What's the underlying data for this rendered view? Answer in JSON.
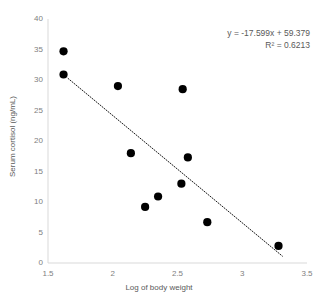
{
  "chart_data": {
    "type": "scatter",
    "title": "",
    "xlabel": "Log of body weight",
    "ylabel": "Serum cortisol (ng/mL)",
    "xlim": [
      1.5,
      3.5
    ],
    "ylim": [
      0,
      40
    ],
    "xticks": [
      "1.5",
      "2",
      "2.5",
      "3",
      "3.5"
    ],
    "xtick_values": [
      1.5,
      2,
      2.5,
      3,
      3.5
    ],
    "yticks": [
      "0",
      "5",
      "10",
      "15",
      "20",
      "25",
      "30",
      "35",
      "40"
    ],
    "ytick_values": [
      0,
      5,
      10,
      15,
      20,
      25,
      30,
      35,
      40
    ],
    "grid": false,
    "legend": "none",
    "marker_color": "#000000",
    "marker_shape": "circle",
    "axis_color": "#d9d9d9",
    "text_color": "#595959",
    "tick_color": "#808080",
    "points": [
      {
        "x": 1.62,
        "y": 34.7
      },
      {
        "x": 1.62,
        "y": 30.9
      },
      {
        "x": 2.04,
        "y": 29.0
      },
      {
        "x": 2.54,
        "y": 28.5
      },
      {
        "x": 2.14,
        "y": 18.0
      },
      {
        "x": 2.58,
        "y": 17.3
      },
      {
        "x": 2.53,
        "y": 13.0
      },
      {
        "x": 2.35,
        "y": 10.9
      },
      {
        "x": 2.25,
        "y": 9.2
      },
      {
        "x": 2.73,
        "y": 6.7
      },
      {
        "x": 3.28,
        "y": 2.8
      }
    ],
    "trendline": {
      "type": "linear",
      "style": "dotted",
      "color": "#000000",
      "slope": -17.599,
      "intercept": 59.379,
      "x_start": 1.655,
      "x_end": 3.31
    },
    "annotations": {
      "equation": "y = -17.599x + 59.379",
      "r_squared": "R² = 0.6213"
    }
  }
}
